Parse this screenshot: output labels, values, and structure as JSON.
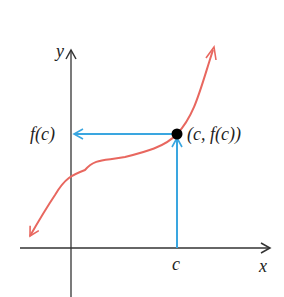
{
  "diagram": {
    "axes": {
      "x_label": "x",
      "y_label": "y"
    },
    "labels": {
      "c": "c",
      "fc": "f(c)",
      "point": "(c, f(c))"
    },
    "colors": {
      "curve": "#e8675f",
      "arrows": "#3aa6e0",
      "axes": "#333333",
      "point": "#000000"
    }
  }
}
